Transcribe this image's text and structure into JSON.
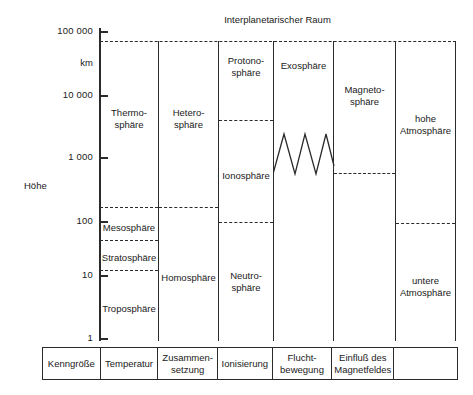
{
  "figure": {
    "top_caption": "Interplanetarischer Raum",
    "axis": {
      "name": "Höhe",
      "unit": "km",
      "ticks": [
        {
          "label": "100 000",
          "y": 31
        },
        {
          "label": "10 000",
          "y": 95
        },
        {
          "label": "1 000",
          "y": 157
        },
        {
          "label": "100",
          "y": 221
        },
        {
          "label": "10",
          "y": 275
        },
        {
          "label": "1",
          "y": 338
        }
      ]
    },
    "columns": [
      {
        "key": "temperatur",
        "footer": "Temperatur",
        "layers": [
          "Thermo-\nsphäre",
          "Mesosphäre",
          "Stratosphäre",
          "Troposphäre"
        ]
      },
      {
        "key": "zusammensetzung",
        "footer": "Zusammen-\nsetzung",
        "layers": [
          "Hetero-\nsphäre",
          "Homosphäre"
        ]
      },
      {
        "key": "ionisierung",
        "footer": "Ionisierung",
        "layers": [
          "Protono-\nsphäre",
          "Ionosphäre",
          "Neutro-\nsphäre"
        ]
      },
      {
        "key": "fluchtbewegung",
        "footer": "Flucht-\nbewegung",
        "layers": [
          "Exosphäre"
        ]
      },
      {
        "key": "magnetfeld",
        "footer": "Einfluß des\nMagnetfeldes",
        "layers": [
          "Magneto-\nsphäre"
        ]
      },
      {
        "key": "atmosphaere",
        "footer": "",
        "layers": [
          "hohe\nAtmosphäre",
          "untere\nAtmosphäre"
        ]
      }
    ],
    "footer_first_cell": "Kenngröße",
    "labels": {
      "thermosphaere": "Thermo-\nsphäre",
      "mesosphaere": "Mesosphäre",
      "stratosphaere": "Stratosphäre",
      "troposphaere": "Troposphäre",
      "heterosphaere": "Hetero-\nsphäre",
      "homosphaere": "Homosphäre",
      "protonosphaere": "Protono-\nsphäre",
      "ionosphaere": "Ionosphäre",
      "neutrosphaere": "Neutro-\nsphäre",
      "exosphaere": "Exosphäre",
      "magnetosphaere": "Magneto-\nsphäre",
      "hohe_atmosphaere": "hohe\nAtmosphäre",
      "untere_atmosphaere": "untere\nAtmosphäre"
    },
    "footers": {
      "kenngroesse": "Kenngröße",
      "temperatur": "Temperatur",
      "zusammensetzung": "Zusammen-\nsetzung",
      "ionisierung": "Ionisierung",
      "fluchtbewegung": "Flucht-\nbewegung",
      "magnetfeld": "Einfluß des\nMagnetfeldes",
      "empty": ""
    },
    "colors": {
      "ink": "#2b2b2b",
      "text": "#1a1a1a",
      "background": "#ffffff"
    }
  }
}
